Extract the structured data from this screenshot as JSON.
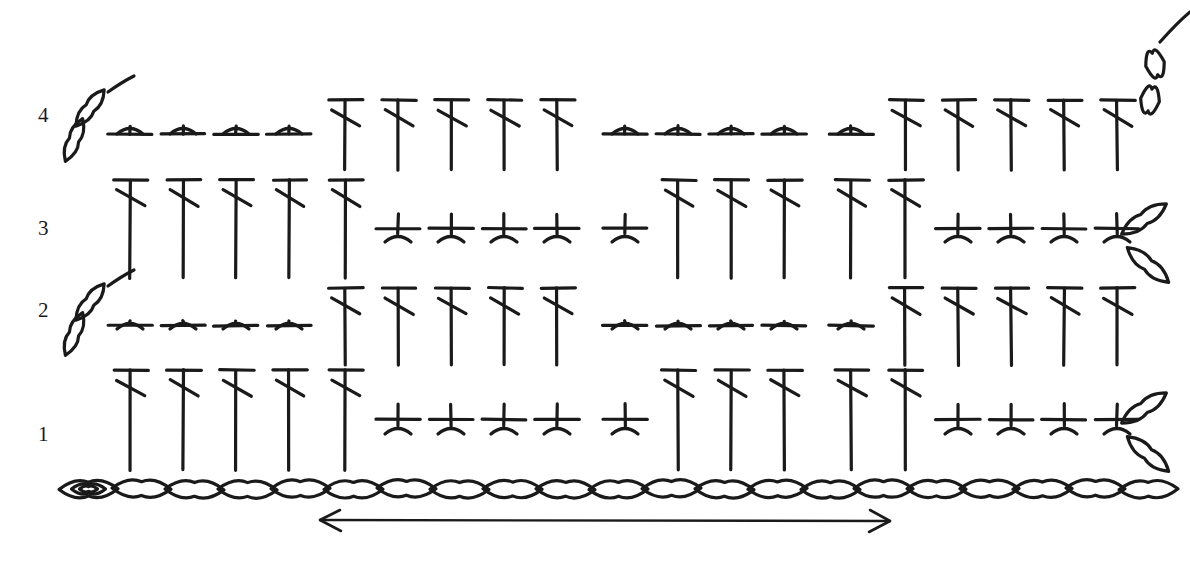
{
  "diagram": {
    "ink_color": "#1a1a1a",
    "background": "#ffffff",
    "stroke_width": 3.2,
    "geometry": {
      "col_x": [
        130,
        183,
        236,
        289,
        345,
        398,
        451,
        504,
        557,
        625,
        678,
        731,
        784,
        851,
        905,
        958,
        1011,
        1064,
        1117
      ],
      "col_spacing": 53,
      "base_y": 489,
      "row_baselines": {
        "r1": 470,
        "r2": 365,
        "r3": 278,
        "r4": 170
      },
      "row_tops": {
        "r1": 370,
        "r2": 288,
        "r3": 180,
        "r4": 100
      }
    },
    "row_labels": [
      {
        "text": "1",
        "x": 38,
        "y": 424
      },
      {
        "text": "2",
        "x": 38,
        "y": 300
      },
      {
        "text": "3",
        "x": 38,
        "y": 218
      },
      {
        "text": "4",
        "x": 38,
        "y": 105
      }
    ],
    "legend_counts": {
      "foundation_chain_count": 21,
      "rows": 4,
      "stitch_groups_per_row": 4
    },
    "rows": [
      {
        "number": "1",
        "kind": "odd",
        "groups": [
          {
            "type": "treble-tall",
            "columns": [
              130,
              183,
              236,
              289,
              345
            ],
            "note": "long stitch spanning two row heights"
          },
          {
            "type": "double-crochet-cross",
            "columns": [
              398,
              451,
              504,
              557,
              625
            ],
            "note": "short cross stitch with fork foot"
          },
          {
            "type": "treble-tall",
            "columns": [
              678,
              731,
              784,
              851,
              905
            ]
          },
          {
            "type": "double-crochet-cross",
            "columns": [
              958,
              1011,
              1064,
              1117
            ]
          }
        ],
        "turning_chain": {
          "side": "right",
          "orientation": "bent",
          "links": 2,
          "x": 1150,
          "y": 432
        }
      },
      {
        "number": "2",
        "kind": "even",
        "groups": [
          {
            "type": "double-crochet-cross",
            "columns": [
              130,
              183,
              236,
              289
            ]
          },
          {
            "type": "treble-tall",
            "columns": [
              345,
              398,
              451,
              504,
              557
            ]
          },
          {
            "type": "double-crochet-cross",
            "columns": [
              625,
              678,
              731,
              784,
              851
            ]
          },
          {
            "type": "treble-tall",
            "columns": [
              905,
              958,
              1011,
              1064,
              1117
            ]
          }
        ],
        "turning_chain": {
          "side": "left",
          "orientation": "diagonal",
          "links": 2,
          "x": 78,
          "y": 322
        }
      },
      {
        "number": "3",
        "kind": "odd",
        "groups": [
          {
            "type": "treble-tall",
            "columns": [
              130,
              183,
              236,
              289,
              345
            ]
          },
          {
            "type": "double-crochet-cross",
            "columns": [
              398,
              451,
              504,
              557,
              625
            ]
          },
          {
            "type": "treble-tall",
            "columns": [
              678,
              731,
              784,
              851,
              905
            ]
          },
          {
            "type": "double-crochet-cross",
            "columns": [
              958,
              1011,
              1064,
              1117
            ]
          }
        ],
        "turning_chain": {
          "side": "right",
          "orientation": "bent",
          "links": 2,
          "x": 1150,
          "y": 243
        }
      },
      {
        "number": "4",
        "kind": "even",
        "groups": [
          {
            "type": "double-crochet-cross",
            "columns": [
              130,
              183,
              236,
              289
            ]
          },
          {
            "type": "treble-tall",
            "columns": [
              345,
              398,
              451,
              504,
              557
            ]
          },
          {
            "type": "double-crochet-cross",
            "columns": [
              625,
              678,
              731,
              784,
              851
            ]
          },
          {
            "type": "treble-tall",
            "columns": [
              905,
              958,
              1011,
              1064,
              1117
            ]
          }
        ],
        "turning_chain": {
          "side": "left",
          "orientation": "diagonal",
          "links": 2,
          "x": 78,
          "y": 128
        },
        "end_chain": {
          "side": "right",
          "orientation": "vertical",
          "links": 2,
          "x": 1152,
          "y": 78,
          "tail": true
        }
      }
    ],
    "foundation_chain": {
      "label": "foundation chain",
      "y": 489,
      "start_x": 62,
      "link_width": 53,
      "count": 21,
      "slip_knot_at_start": true
    },
    "repeat_arrow": {
      "label": "pattern repeat",
      "y": 520,
      "x_start": 320,
      "x_end": 890,
      "double_headed": true
    },
    "chart_data": {
      "type": "table",
      "title": "Crochet stitch chart — 4 rows over 21 foundation chains",
      "xlabel": "stitch column",
      "ylabel": "row",
      "grid": false,
      "legend_position": "none",
      "categories": [
        "col1",
        "col2",
        "col3",
        "col4",
        "col5",
        "col6",
        "col7",
        "col8",
        "col9",
        "col10",
        "col11",
        "col12",
        "col13",
        "col14",
        "col15",
        "col16",
        "col17",
        "col18",
        "col19"
      ],
      "series": [
        {
          "name": "Row 1",
          "values": [
            "T",
            "T",
            "T",
            "T",
            "T",
            "X",
            "X",
            "X",
            "X",
            "X",
            "T",
            "T",
            "T",
            "T",
            "T",
            "X",
            "X",
            "X",
            "X"
          ]
        },
        {
          "name": "Row 2",
          "values": [
            "X",
            "X",
            "X",
            "X",
            "T",
            "T",
            "T",
            "T",
            "T",
            "X",
            "X",
            "X",
            "X",
            "X",
            "T",
            "T",
            "T",
            "T",
            "T"
          ]
        },
        {
          "name": "Row 3",
          "values": [
            "T",
            "T",
            "T",
            "T",
            "T",
            "X",
            "X",
            "X",
            "X",
            "X",
            "T",
            "T",
            "T",
            "T",
            "T",
            "X",
            "X",
            "X",
            "X"
          ]
        },
        {
          "name": "Row 4",
          "values": [
            "X",
            "X",
            "X",
            "X",
            "T",
            "T",
            "T",
            "T",
            "T",
            "X",
            "X",
            "X",
            "X",
            "X",
            "T",
            "T",
            "T",
            "T",
            "T"
          ]
        }
      ],
      "value_key": {
        "T": "tall treble / long double crochet",
        "X": "short cross stitch (double crochet)"
      },
      "annotations": [
        {
          "text": "1",
          "type": "row-number"
        },
        {
          "text": "2",
          "type": "row-number"
        },
        {
          "text": "3",
          "type": "row-number"
        },
        {
          "text": "4",
          "type": "row-number"
        },
        {
          "text": "pattern repeat",
          "type": "double-arrow"
        }
      ]
    }
  }
}
